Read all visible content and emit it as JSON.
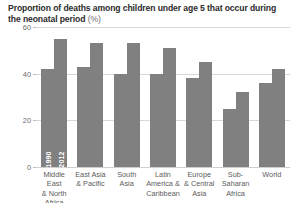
{
  "chart_data": {
    "type": "bar",
    "title": "Proportion of deaths among children under age 5 that occur during the neonatal period",
    "title_unit": "(%)",
    "xlabel": "",
    "ylabel": "",
    "ylim": [
      0,
      60
    ],
    "yticks": [
      0,
      20,
      40,
      60
    ],
    "ytick_labels": [
      "0",
      "20",
      "40",
      "60"
    ],
    "grid": true,
    "legend_position": "inside-first-bars",
    "categories": [
      "Middle East & North Africa",
      "East Asia & Pacific",
      "South Asia",
      "Latin America & Caribbean",
      "Europe & Central Asia",
      "Sub-Saharan Africa",
      "World"
    ],
    "category_lines": [
      [
        "Middle East",
        "& North",
        "Africa"
      ],
      [
        "East Asia",
        "& Pacific"
      ],
      [
        "South",
        "Asia"
      ],
      [
        "Latin",
        "America &",
        "Caribbean"
      ],
      [
        "Europe",
        "& Central",
        "Asia"
      ],
      [
        "Sub-Saharan",
        "Africa"
      ],
      [
        "World"
      ]
    ],
    "series": [
      {
        "name": "1990",
        "values": [
          42,
          43,
          40,
          40,
          38,
          25,
          36
        ]
      },
      {
        "name": "2012",
        "values": [
          55,
          53,
          53,
          51,
          45,
          32,
          42
        ]
      }
    ],
    "bar_color": "#808080",
    "gridline_color": "#d8d8d8",
    "background_color": "#ffffff"
  }
}
